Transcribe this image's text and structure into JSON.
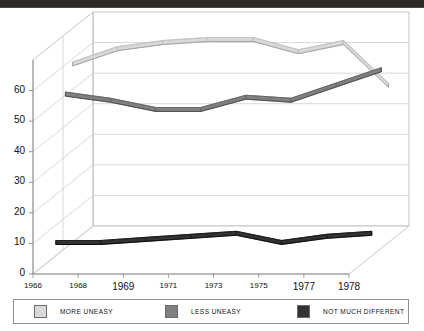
{
  "window": {
    "title_strip_color": "#2e2926"
  },
  "chart_data": {
    "type": "line",
    "title": "",
    "subtitle": "",
    "xlabel": "",
    "ylabel": "",
    "x": [
      1966,
      1968,
      1969,
      1971,
      1973,
      1975,
      1977,
      1978
    ],
    "categories": [
      "1966",
      "1968",
      "1969",
      "1971",
      "1973",
      "1975",
      "1977",
      "1978"
    ],
    "ylim": [
      0,
      70
    ],
    "yticks": [
      0,
      10,
      20,
      30,
      40,
      50,
      60
    ],
    "ytick_labels": [
      "0",
      "10",
      "20",
      "30",
      "40",
      "50",
      "60"
    ],
    "grid": true,
    "grid_axis": "y",
    "legend_position": "bottom",
    "projection": "3d-perspective",
    "series": [
      {
        "name": "MORE UNEASY",
        "color": "#d9d9d9",
        "values": [
          59,
          64,
          66,
          67,
          67,
          63,
          66,
          52
        ]
      },
      {
        "name": "LESS UNEASY",
        "color": "#808080",
        "values": [
          51,
          49,
          46,
          46,
          50,
          49,
          54,
          59
        ]
      },
      {
        "name": "NOT MUCH DIFFERENT",
        "color": "#333333",
        "values": [
          5,
          5,
          6,
          7,
          8,
          5,
          7,
          8
        ]
      }
    ]
  },
  "legend": {
    "items": [
      {
        "label": "MORE UNEASY",
        "color": "#d9d9d9"
      },
      {
        "label": "LESS UNEASY",
        "color": "#808080"
      },
      {
        "label": "NOT MUCH DIFFERENT",
        "color": "#333333"
      }
    ]
  }
}
